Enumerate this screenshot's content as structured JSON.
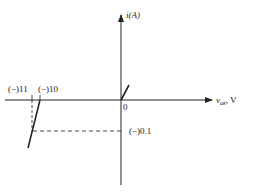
{
  "diagram": {
    "y_axis_label_var": "i",
    "y_axis_label_unit": "(A)",
    "x_axis_label_var": "v",
    "x_axis_label_sub": "ak",
    "x_axis_label_unit": ", V",
    "origin_label": "0",
    "reverse_tick_11": "(−)11",
    "reverse_tick_10": "(−)10",
    "current_tick": "(−)0.1",
    "colors": {
      "line": "#222222",
      "background": "#ffffff"
    }
  }
}
